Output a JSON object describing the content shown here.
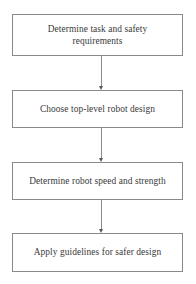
{
  "diagram": {
    "background_color": "#ffffff",
    "box_border_color": "#8a8a8a",
    "text_color": "#3a3a3a",
    "arrow_color": "#555555",
    "nodes": [
      {
        "id": "node-1",
        "label": "Determine task and safety\nrequirements",
        "shape": "rectangle"
      },
      {
        "id": "node-2",
        "label": "Choose top-level robot design",
        "shape": "rectangle"
      },
      {
        "id": "node-3",
        "label": "Determine robot speed and strength",
        "shape": "rectangle"
      },
      {
        "id": "node-4",
        "label": "Apply guidelines for safer design",
        "shape": "rectangle"
      }
    ],
    "connectors": [
      {
        "id": "connector-1",
        "from": "node-1",
        "to": "node-2",
        "style": "arrow-down"
      },
      {
        "id": "connector-2",
        "from": "node-2",
        "to": "node-3",
        "style": "arrow-down"
      },
      {
        "id": "connector-3",
        "from": "node-3",
        "to": "node-4",
        "style": "arrow-down"
      }
    ]
  }
}
